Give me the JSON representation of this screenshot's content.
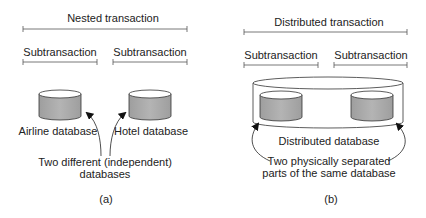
{
  "panel_a": {
    "title": "Nested transaction",
    "subtransactions": [
      "Subtransaction",
      "Subtransaction"
    ],
    "databases": [
      "Airline database",
      "Hotel database"
    ],
    "annotation_line1": "Two different (independent)",
    "annotation_line2": "databases",
    "caption": "(a)"
  },
  "panel_b": {
    "title": "Distributed transaction",
    "subtransactions": [
      "Subtransaction",
      "Subtransaction"
    ],
    "container_label": "Distributed database",
    "annotation_line1": "Two physically separated",
    "annotation_line2": "parts of the same database",
    "caption": "(b)"
  },
  "colors": {
    "cylinder_fill": "#aaaaaa",
    "cylinder_top": "#ffffff",
    "stroke": "#333333"
  }
}
